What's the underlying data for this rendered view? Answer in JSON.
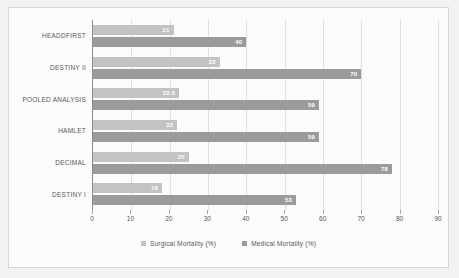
{
  "chart_data": {
    "type": "bar",
    "orientation": "horizontal",
    "title": "",
    "xlabel": "",
    "ylabel": "",
    "xlim": [
      0,
      90
    ],
    "xticks": [
      0,
      10,
      20,
      30,
      40,
      50,
      60,
      70,
      80,
      90
    ],
    "xtick_labels": [
      "0",
      "10",
      "20",
      "30",
      "40",
      "50",
      "60",
      "70",
      "80",
      "90"
    ],
    "grid": "vertical",
    "legend_position": "bottom",
    "categories": [
      "HEADDFIRST",
      "DESTINY II",
      "POOLED ANALYSIS",
      "HAMLET",
      "DECIMAL",
      "DESTINY I"
    ],
    "series": [
      {
        "name": "Surgical Mortality (%)",
        "color": "#c3c3c3",
        "values": [
          21,
          33,
          22.5,
          22,
          25,
          18
        ],
        "labels": [
          "21",
          "33",
          "22.5",
          "22",
          "25",
          "18"
        ]
      },
      {
        "name": "Medical Mortality (%)",
        "color": "#9b9b9b",
        "values": [
          40,
          70,
          59,
          59,
          78,
          53
        ],
        "labels": [
          "40",
          "70",
          "59",
          "59",
          "78",
          "53"
        ]
      }
    ]
  },
  "colors": {
    "surgical": "#c3c3c3",
    "medical": "#9b9b9b",
    "axis": "#8c8c8c",
    "grid": "#dedede",
    "text": "#58585a",
    "plot_background": "#fbfbfb",
    "page_background": "#f2f2f2"
  }
}
